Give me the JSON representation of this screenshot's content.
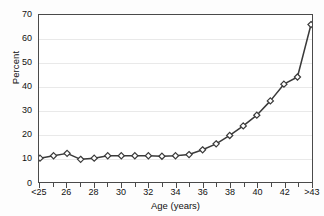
{
  "chart_data": {
    "type": "line",
    "title": "",
    "subtitle": "",
    "xlabel": "Age (years)",
    "ylabel": "Percent",
    "categories": [
      "<25",
      "25",
      "26",
      "27",
      "28",
      "29",
      "30",
      "31",
      "32",
      "33",
      "34",
      "35",
      "36",
      "37",
      "38",
      "39",
      "40",
      "41",
      "42",
      "43",
      ">43"
    ],
    "values": [
      10,
      11,
      12,
      9.5,
      10,
      11,
      11,
      11,
      11,
      10.8,
      11,
      11.5,
      13.5,
      16,
      19.5,
      23.5,
      28,
      34,
      41,
      44,
      66
    ],
    "series": [
      {
        "name": "Percent",
        "values": [
          10,
          11,
          12,
          9.5,
          10,
          11,
          11,
          11,
          11,
          10.8,
          11,
          11.5,
          13.5,
          16,
          19.5,
          23.5,
          28,
          34,
          41,
          44,
          66
        ]
      }
    ],
    "ylim": [
      0,
      70
    ],
    "yticks": [
      0,
      10,
      20,
      30,
      40,
      50,
      60,
      70
    ],
    "ytick_labels": [
      "0",
      "10",
      "20",
      "30",
      "40",
      "50",
      "60",
      "70"
    ],
    "xtick_labels": [
      "<25",
      "26",
      "28",
      "30",
      "32",
      "34",
      "36",
      "38",
      "40",
      "42",
      ">43"
    ],
    "xtick_indices": [
      0,
      2,
      4,
      6,
      8,
      10,
      12,
      14,
      16,
      18,
      20
    ],
    "grid": "horizontal",
    "legend": "none",
    "marker": "open-diamond",
    "line_color": "#3a3a3a",
    "marker_face_color": "#ffffff",
    "grid_color": "#e9e9e9",
    "axis_color": "#4a4a4a",
    "background_color": "#ffffff"
  }
}
